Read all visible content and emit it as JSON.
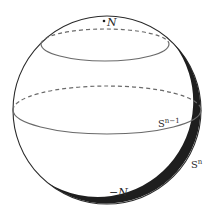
{
  "diagram": {
    "type": "sphere-with-latitude-circles",
    "background": "#ffffff",
    "stroke_color": "#2a2a2a",
    "circle_color": "#6a6a6a",
    "sphere": {
      "label": "S",
      "label_sup": "n"
    },
    "equator": {
      "label": "S",
      "label_sup": "n−1",
      "style_front": "solid",
      "style_back": "dashed"
    },
    "upper_circle": {
      "style_front": "solid",
      "style_back": "dashed"
    },
    "points": [
      {
        "id": "north",
        "label": "N"
      },
      {
        "id": "south",
        "label": "−N"
      }
    ]
  }
}
